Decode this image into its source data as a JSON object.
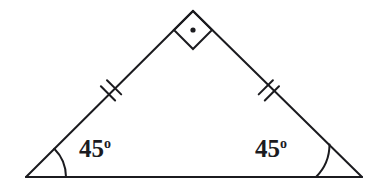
{
  "figure": {
    "name": "isosceles-right-triangle",
    "background_color": "#ffffff",
    "stroke_color": "#1b1b1f",
    "text_color": "#1b1b1f",
    "stroke_width": 2
  },
  "vertices": {
    "apex": {
      "label": "apex",
      "x": 193,
      "y": 11
    },
    "bottom_left": {
      "label": "bottom-left",
      "x": 26,
      "y": 177
    },
    "bottom_right": {
      "label": "bottom-right",
      "x": 362,
      "y": 177
    }
  },
  "sides": {
    "left_leg": {
      "name": "left-leg",
      "tick_count": 2,
      "congruent": true
    },
    "right_leg": {
      "name": "right-leg",
      "tick_count": 2,
      "congruent": true
    },
    "base": {
      "name": "base",
      "tick_count": 0,
      "congruent": false
    }
  },
  "angles": {
    "apex": {
      "value": 90,
      "marker": "square-with-dot",
      "label_text": "",
      "marker_dot": true
    },
    "bottom_left": {
      "value": 45,
      "number": "45",
      "degree_symbol": "o",
      "marker": "arc",
      "arc_radius": 40
    },
    "bottom_right": {
      "value": 45,
      "number": "45",
      "degree_symbol": "o",
      "marker": "arc",
      "arc_radius": 46
    }
  },
  "labels": {
    "left_angle": {
      "number": "45",
      "degree": "o"
    },
    "right_angle": {
      "number": "45",
      "degree": "o"
    }
  }
}
